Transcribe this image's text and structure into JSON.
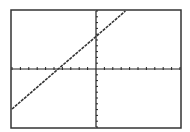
{
  "chart_data": {
    "type": "line",
    "title": "",
    "xlabel": "",
    "ylabel": "",
    "xlim": [
      -10,
      10
    ],
    "ylim": [
      -10,
      10
    ],
    "xscl": 1,
    "yscl": 1,
    "grid": false,
    "legend": null,
    "series": [
      {
        "name": "Y1",
        "equation": "y = 1.25x + 5.6",
        "x": [
          -10,
          -4.5,
          0,
          3.5
        ],
        "y": [
          -6.9,
          0,
          5.6,
          10
        ]
      }
    ]
  },
  "frame": {
    "left": 11,
    "top": 10,
    "right": 181,
    "bottom": 128
  },
  "colors": {
    "background": "#ffffff",
    "frame": "#333333",
    "axes": "#222222",
    "line": "#333333"
  }
}
